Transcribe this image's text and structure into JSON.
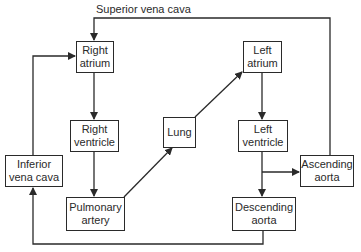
{
  "diagram": {
    "title_label": "Superior vena cava",
    "nodes": {
      "right_atrium": {
        "line1": "Right",
        "line2": "atrium"
      },
      "right_ventricle": {
        "line1": "Right",
        "line2": "ventricle"
      },
      "pulmonary_artery": {
        "line1": "Pulmonary",
        "line2": "artery"
      },
      "lung": {
        "line1": "Lung"
      },
      "left_atrium": {
        "line1": "Left",
        "line2": "atrium"
      },
      "left_ventricle": {
        "line1": "Left",
        "line2": "ventricle"
      },
      "ascending_aorta": {
        "line1": "Ascending",
        "line2": "aorta"
      },
      "descending_aorta": {
        "line1": "Descending",
        "line2": "aorta"
      },
      "inferior_vena_cava": {
        "line1": "Inferior",
        "line2": "vena cava"
      }
    },
    "edges": [
      {
        "from": "Superior vena cava",
        "to": "Right atrium"
      },
      {
        "from": "Inferior vena cava",
        "to": "Right atrium"
      },
      {
        "from": "Right atrium",
        "to": "Right ventricle"
      },
      {
        "from": "Right ventricle",
        "to": "Pulmonary artery"
      },
      {
        "from": "Pulmonary artery",
        "to": "Lung"
      },
      {
        "from": "Lung",
        "to": "Left atrium"
      },
      {
        "from": "Left atrium",
        "to": "Left ventricle"
      },
      {
        "from": "Left ventricle",
        "to": "Ascending aorta"
      },
      {
        "from": "Left ventricle",
        "to": "Descending aorta"
      },
      {
        "from": "Ascending aorta",
        "to": "Superior vena cava"
      },
      {
        "from": "Descending aorta",
        "to": "Inferior vena cava"
      }
    ],
    "colors": {
      "line": "#2a2a2a",
      "background": "#ffffff"
    }
  }
}
